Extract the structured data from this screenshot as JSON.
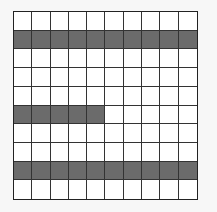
{
  "grid": {
    "rows": 10,
    "cols": 10,
    "shade_color": "#6b6b6b",
    "fill_color": "#ffffff",
    "shaded_cells": [
      {
        "row": 1,
        "cols": [
          0,
          1,
          2,
          3,
          4,
          5,
          6,
          7,
          8,
          9
        ]
      },
      {
        "row": 5,
        "cols": [
          0,
          1,
          2,
          3,
          4
        ]
      },
      {
        "row": 8,
        "cols": [
          0,
          1,
          2,
          3,
          4,
          5,
          6,
          7,
          8,
          9
        ]
      }
    ],
    "shaded_count": 25,
    "total_count": 100
  }
}
